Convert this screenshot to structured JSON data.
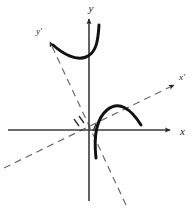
{
  "figure": {
    "kind": "rotated-conic-axes-diagram",
    "width": 193,
    "height": 209,
    "background_color": "#ffffff",
    "origin": {
      "x": 88,
      "y": 130
    },
    "labels": {
      "y_axis": "y",
      "x_axis": "x",
      "y_prime_axis": "y'",
      "x_prime_axis": "x'"
    },
    "colors": {
      "curve": "#121212",
      "axis": "#3b3b3b",
      "dashed_axis": "#6b6b6b",
      "tick": "#2b2b2b",
      "label": "#1a1a1a"
    },
    "axes": [
      {
        "name": "x-axis",
        "style": "solid",
        "label": "x",
        "label_position": {
          "x": 182,
          "y": 134
        },
        "from": {
          "x": 8,
          "y": 130
        },
        "to": {
          "x": 170,
          "y": 130
        },
        "arrow": "end"
      },
      {
        "name": "y-axis",
        "style": "solid",
        "label": "y",
        "label_position": {
          "x": 91,
          "y": 12
        },
        "from": {
          "x": 89,
          "y": 201
        },
        "to": {
          "x": 89,
          "y": 19
        },
        "arrow": "end"
      },
      {
        "name": "x-prime-axis",
        "style": "dashed",
        "label": "x'",
        "label_position": {
          "x": 180,
          "y": 80
        },
        "from": {
          "x": 4,
          "y": 168
        },
        "to": {
          "x": 174,
          "y": 85
        },
        "arrow": "end",
        "rotation_degrees": 26
      },
      {
        "name": "y-prime-axis",
        "style": "dashed",
        "label": "y'",
        "label_position": {
          "x": 37,
          "y": 33
        },
        "from": {
          "x": 126,
          "y": 205
        },
        "to": {
          "x": 50,
          "y": 42
        },
        "arrow": "end",
        "rotation_degrees": 26
      }
    ],
    "ticks": [
      {
        "name": "y-prime-tick-1",
        "from": {
          "x": 74,
          "y": 119
        },
        "to": {
          "x": 79,
          "y": 126
        }
      },
      {
        "name": "y-prime-tick-2",
        "from": {
          "x": 79,
          "y": 116
        },
        "to": {
          "x": 84,
          "y": 123
        }
      },
      {
        "name": "x-prime-tick-1",
        "from": {
          "x": 93,
          "y": 131
        },
        "to": {
          "x": 96,
          "y": 124
        }
      }
    ],
    "curves": [
      {
        "name": "upper-left-branch",
        "description": "hyperbola branch opening toward upper-left, vertex near lower-middle, rising on both ends",
        "stroke_width": 3,
        "path": "M 99 25 C 98 42, 96 53, 86 57 C 76 61, 63 54, 53 45"
      },
      {
        "name": "lower-right-branch",
        "description": "hyperbola branch opening toward lower-right, arching over and down to the right",
        "stroke_width": 3,
        "path": "M 96 158 C 94 140, 95 120, 107 110 C 119 100, 131 109, 141 125"
      }
    ]
  }
}
